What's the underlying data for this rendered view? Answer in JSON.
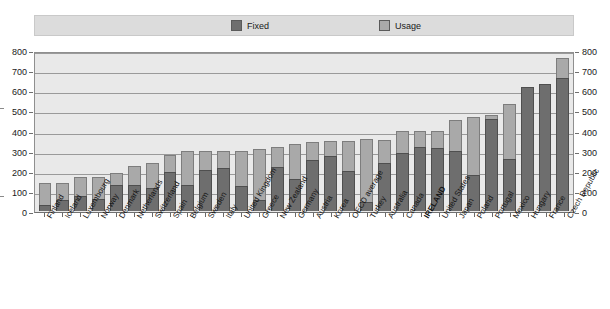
{
  "legend": {
    "items": [
      {
        "label": "Fixed",
        "color": "#6e6e6e",
        "icon": "square-swatch-icon"
      },
      {
        "label": "Usage",
        "color": "#a9a9a9",
        "icon": "square-swatch-icon"
      }
    ]
  },
  "axis": {
    "y_ticks_left": [
      "800",
      "700",
      "600",
      "500",
      "400",
      "300",
      "200",
      "100",
      "0"
    ],
    "y_ticks_right": [
      "800",
      "700",
      "600",
      "500",
      "400",
      "300",
      "200",
      "100",
      "0"
    ]
  },
  "highlight_category": "IRELAND",
  "chart_data": {
    "type": "bar",
    "stacked": true,
    "title": "",
    "subtitle": "",
    "xlabel": "",
    "ylabel": "",
    "ylim": [
      0,
      800
    ],
    "ytick_step": 100,
    "grid": true,
    "legend_position": "top",
    "categories": [
      "Finland",
      "Iceland",
      "Luxembourg",
      "Norway",
      "Denmark",
      "Netherlands",
      "Switzerland",
      "Spain",
      "Belgium",
      "Sweden",
      "Italy",
      "United Kingdom",
      "Greece",
      "New Zealand",
      "Germany",
      "Austria",
      "Korea",
      "OECD average",
      "Turkey",
      "Australia",
      "Canada",
      "IRELAND",
      "United States",
      "Japan",
      "Poland",
      "Portugal",
      "Mexico",
      "Hungary",
      "France",
      "Czech Republic"
    ],
    "series": [
      {
        "name": "Fixed",
        "color": "#6e6e6e",
        "values": [
          30,
          57,
          75,
          60,
          128,
          128,
          114,
          195,
          131,
          205,
          212,
          125,
          55,
          220,
          160,
          255,
          275,
          200,
          45,
          240,
          290,
          320,
          315,
          300,
          180,
          455,
          260,
          615,
          630,
          660
        ]
      },
      {
        "name": "Usage",
        "color": "#a9a9a9",
        "values": [
          110,
          83,
          95,
          110,
          60,
          97,
          125,
          85,
          169,
          95,
          88,
          175,
          255,
          100,
          175,
          90,
          75,
          150,
          315,
          115,
          110,
          80,
          85,
          150,
          285,
          20,
          270,
          0,
          0,
          100
        ]
      }
    ],
    "totals": [
      140,
      140,
      170,
      170,
      188,
      225,
      239,
      280,
      300,
      300,
      300,
      300,
      310,
      320,
      335,
      345,
      350,
      350,
      360,
      355,
      400,
      400,
      400,
      450,
      465,
      475,
      530,
      615,
      630,
      760
    ]
  }
}
